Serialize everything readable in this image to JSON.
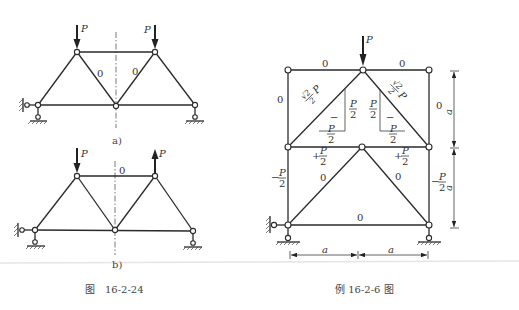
{
  "figure_left": {
    "caption": "图　16-2-24",
    "sub_a": {
      "label": "a)",
      "loads": [
        {
          "name": "P",
          "node": "top-left",
          "direction": "down"
        },
        {
          "name": "P",
          "node": "top-right",
          "direction": "down"
        }
      ],
      "member_labels": [
        "0",
        "0"
      ]
    },
    "sub_b": {
      "label": "b)",
      "loads": [
        {
          "name": "P",
          "node": "top-left",
          "direction": "down"
        },
        {
          "name": "P",
          "node": "top-right",
          "direction": "up"
        }
      ],
      "member_labels": [
        "0"
      ]
    }
  },
  "figure_right": {
    "caption": "例 16-2-6 图",
    "load": {
      "name": "P",
      "direction": "down"
    },
    "member_labels": {
      "top_left": "0",
      "top_right": "0",
      "left_upper": "0",
      "right_upper": "0",
      "diag_left": "√2/2 P",
      "diag_right": "√2/2 P",
      "diag_sign": "−",
      "vert_comp_left": "P/2",
      "vert_comp_right": "P/2",
      "horiz_comp_left": "P/2",
      "horiz_comp_right": "P/2",
      "mid_left": "+P/2",
      "mid_right": "+P/2",
      "lower_diag_left": "0",
      "lower_diag_right": "0",
      "left_lower": "−P/2",
      "right_lower": "−P/2",
      "bottom": "0"
    },
    "dimensions": {
      "vertical": [
        "a",
        "a"
      ],
      "horizontal": [
        "a",
        "a"
      ]
    }
  },
  "symbols": {
    "P": "P",
    "half_num": "P",
    "half_den": "2",
    "plus": "+",
    "minus": "−",
    "zero": "0",
    "a": "a",
    "sqrt2": "√2",
    "two": "2"
  }
}
